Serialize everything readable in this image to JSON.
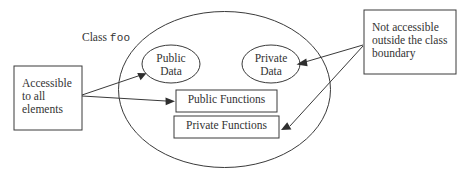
{
  "diagram": {
    "class_boundary": {
      "label_prefix": "Class",
      "label_name": "foo",
      "shape": "ellipse"
    },
    "members": {
      "public_data": "Public\nData",
      "private_data": "Private\nData",
      "public_functions": "Public Functions",
      "private_functions": "Private Functions"
    },
    "annotations": {
      "left_note": "Accessible\nto all\nelements",
      "right_note": "Not accessible\noutside the class\nboundary"
    },
    "colors": {
      "stroke": "#3a3a3a",
      "text": "#333333",
      "background": "#ffffff",
      "arrow_fill": "#2e2e2e"
    },
    "connections": [
      {
        "from": "left_note",
        "to": "public_data"
      },
      {
        "from": "left_note",
        "to": "public_functions"
      },
      {
        "from": "right_note",
        "to": "private_data"
      },
      {
        "from": "right_note",
        "to": "private_functions"
      }
    ]
  }
}
